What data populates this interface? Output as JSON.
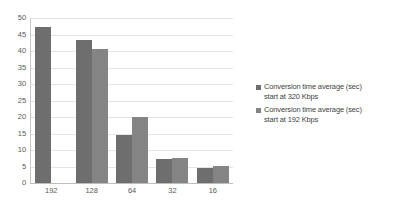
{
  "chart_data": {
    "type": "bar",
    "title": "",
    "subtitle": "",
    "xlabel": "",
    "ylabel": "",
    "categories": [
      "192",
      "128",
      "64",
      "32",
      "16"
    ],
    "series": [
      {
        "name": "Conversion time average (sec) start at 320 Kbps",
        "color": "#6e6e6e",
        "values": [
          47.4,
          43.3,
          14.5,
          7.3,
          4.5
        ]
      },
      {
        "name": "Conversion time average (sec) start at 192 Kbps",
        "color": "#848484",
        "values": [
          null,
          40.6,
          20.0,
          7.6,
          5.3
        ]
      }
    ],
    "ylim": [
      0,
      50
    ],
    "yticks": [
      0,
      5,
      10,
      15,
      20,
      25,
      30,
      35,
      40,
      45,
      50
    ],
    "ytick_labels": [
      "0",
      "5",
      "10",
      "15",
      "20",
      "25",
      "30",
      "35",
      "40",
      "45",
      "50"
    ],
    "grid": true,
    "grid_axis": "y",
    "legend_position": "right",
    "legend": [
      "Conversion time average (sec)\nstart at 320 Kbps",
      "Conversion time average (sec)\nstart at 192 Kbps"
    ],
    "annotations": []
  },
  "colors": {
    "series_0": "#6e6e6e",
    "series_1": "#848484",
    "gridline": "#e4e4e4",
    "axis": "#bdbdbd",
    "tick_text": "#595959",
    "legend_text": "#3f3f3f",
    "background": "#ffffff"
  }
}
